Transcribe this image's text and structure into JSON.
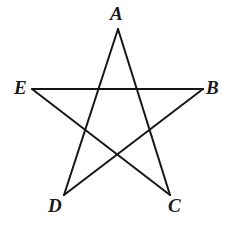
{
  "figure": {
    "type": "pentagram-diagram",
    "background_color": "#ffffff",
    "stroke_color": "#161616",
    "stroke_width": 2,
    "label_color": "#1a1a1a",
    "canvas": {
      "width": 235,
      "height": 225
    }
  },
  "labels": {
    "a": "A",
    "b": "B",
    "c": "C",
    "d": "D",
    "e": "E"
  },
  "chart_data": {
    "type": "diagram",
    "title": "",
    "shape": "pentagram",
    "vertices": [
      {
        "name": "A",
        "x": 118,
        "y": 29,
        "label_position": "above"
      },
      {
        "name": "B",
        "x": 203,
        "y": 89,
        "label_position": "right"
      },
      {
        "name": "C",
        "x": 170,
        "y": 195,
        "label_position": "below-right"
      },
      {
        "name": "D",
        "x": 64,
        "y": 195,
        "label_position": "below-left"
      },
      {
        "name": "E",
        "x": 32,
        "y": 89,
        "label_position": "left"
      }
    ],
    "edges": [
      {
        "from": "A",
        "to": "C"
      },
      {
        "from": "C",
        "to": "E"
      },
      {
        "from": "E",
        "to": "B"
      },
      {
        "from": "B",
        "to": "D"
      },
      {
        "from": "D",
        "to": "A"
      }
    ],
    "grid": false,
    "legend": null,
    "xlabel": "",
    "ylabel": ""
  }
}
